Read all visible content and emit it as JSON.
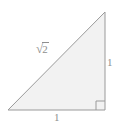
{
  "figure": {
    "type": "right-triangle-diagram",
    "background_color": "#ffffff",
    "fill_color": "#f2f2f2",
    "stroke_color": "#9a9a9a",
    "label_color": "#8e8e8e",
    "vertices": {
      "apex": [
        105,
        12
      ],
      "bottom_left": [
        8,
        110
      ],
      "bottom_right": [
        105,
        110
      ]
    },
    "right_angle_marker": {
      "name": "right-angle-square",
      "corner": [
        105,
        110
      ],
      "size": 9
    },
    "labels": {
      "hypotenuse": {
        "radical_sign": "√",
        "radicand": "2",
        "full_text": "√2"
      },
      "vertical_leg": "1",
      "horizontal_leg": "1"
    }
  }
}
